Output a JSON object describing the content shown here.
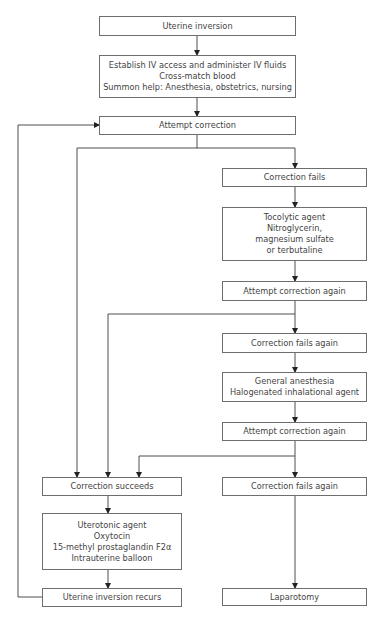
{
  "diagram": {
    "type": "flowchart",
    "colors": {
      "line": "#3a3a3a",
      "border": "#6e6e6e",
      "text": "#444444",
      "background": "#ffffff"
    },
    "nodes": {
      "uterine_inversion": {
        "lines": [
          "Uterine inversion"
        ]
      },
      "initial_management": {
        "lines": [
          "Establish IV access and administer IV fluids",
          "Cross-match blood",
          "Summon help: Anesthesia, obstetrics, nursing"
        ]
      },
      "attempt_correction": {
        "lines": [
          "Attempt correction"
        ]
      },
      "correction_fails_1": {
        "lines": [
          "Correction fails"
        ]
      },
      "tocolytic": {
        "lines": [
          "Tocolytic agent",
          "Nitroglycerin,",
          "magnesium sulfate",
          "or terbutaline"
        ]
      },
      "attempt_again_1": {
        "lines": [
          "Attempt correction again"
        ]
      },
      "correction_fails_2": {
        "lines": [
          "Correction fails again"
        ]
      },
      "general_anesthesia": {
        "lines": [
          "General anesthesia",
          "Halogenated inhalational agent"
        ]
      },
      "attempt_again_2": {
        "lines": [
          "Attempt correction again"
        ]
      },
      "correction_succeeds": {
        "lines": [
          "Correction succeeds"
        ]
      },
      "correction_fails_3": {
        "lines": [
          "Correction fails again"
        ]
      },
      "uterotonic": {
        "lines": [
          "Uterotonic agent",
          "Oxytocin",
          "15-methyl prostaglandin F2α",
          "Intrauterine balloon"
        ]
      },
      "inversion_recurs": {
        "lines": [
          "Uterine inversion recurs"
        ]
      },
      "laparotomy": {
        "lines": [
          "Laparotomy"
        ]
      }
    },
    "edges": [
      [
        "uterine_inversion",
        "initial_management"
      ],
      [
        "initial_management",
        "attempt_correction"
      ],
      [
        "attempt_correction",
        "correction_fails_1"
      ],
      [
        "attempt_correction",
        "correction_succeeds"
      ],
      [
        "correction_fails_1",
        "tocolytic"
      ],
      [
        "tocolytic",
        "attempt_again_1"
      ],
      [
        "attempt_again_1",
        "correction_fails_2"
      ],
      [
        "attempt_again_1",
        "correction_succeeds"
      ],
      [
        "correction_fails_2",
        "general_anesthesia"
      ],
      [
        "general_anesthesia",
        "attempt_again_2"
      ],
      [
        "attempt_again_2",
        "correction_fails_3"
      ],
      [
        "attempt_again_2",
        "correction_succeeds"
      ],
      [
        "correction_succeeds",
        "uterotonic"
      ],
      [
        "uterotonic",
        "inversion_recurs"
      ],
      [
        "inversion_recurs",
        "attempt_correction"
      ],
      [
        "correction_fails_3",
        "laparotomy"
      ]
    ]
  }
}
